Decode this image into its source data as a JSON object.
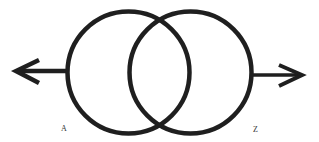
{
  "diagram": {
    "type": "overlapping-circles-with-arrows",
    "stroke_color": "#1f1f1f",
    "background": "#ffffff",
    "circles": [
      {
        "id": "left",
        "cx": 128.5,
        "cy": 72.5,
        "r": 61
      },
      {
        "id": "right",
        "cx": 190.5,
        "cy": 72.5,
        "r": 61
      }
    ],
    "arrows": [
      {
        "id": "left-arrow",
        "direction": "left",
        "from": [
          67,
          71
        ],
        "to": [
          16,
          71
        ]
      },
      {
        "id": "right-arrow",
        "direction": "right",
        "from": [
          252,
          75
        ],
        "to": [
          302,
          75
        ]
      }
    ],
    "labels": {
      "left": "A",
      "right": "Z"
    }
  }
}
